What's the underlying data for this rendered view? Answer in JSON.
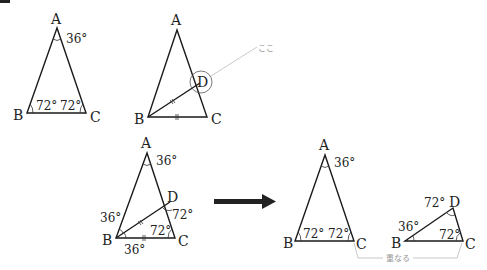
{
  "corner_mark": {
    "color": "#222222"
  },
  "figure1": {
    "vertices": {
      "A": "A",
      "B": "B",
      "C": "C"
    },
    "angles": {
      "A": "36°",
      "B": "72°",
      "C": "72°"
    }
  },
  "figure2": {
    "vertices": {
      "A": "A",
      "B": "B",
      "C": "C",
      "D": "D"
    },
    "callout": "ここ",
    "equal_marks": "BD = BC"
  },
  "figure3": {
    "vertices": {
      "A": "A",
      "B": "B",
      "C": "C",
      "D": "D"
    },
    "angles": {
      "A": "36°",
      "ABD": "36°",
      "DBC": "36°",
      "BDC": "72°",
      "C": "72°"
    }
  },
  "arrow": {
    "color": "#222222",
    "direction": "right"
  },
  "figure4": {
    "vertices": {
      "A": "A",
      "B": "B",
      "C": "C"
    },
    "angles": {
      "A": "36°",
      "B": "72°",
      "C": "72°"
    }
  },
  "figure5": {
    "vertices": {
      "B": "B",
      "C": "C",
      "D": "D"
    },
    "angles": {
      "B": "36°",
      "D": "72°",
      "C": "72°"
    }
  },
  "overlap_bracket": {
    "label": "重なる"
  }
}
